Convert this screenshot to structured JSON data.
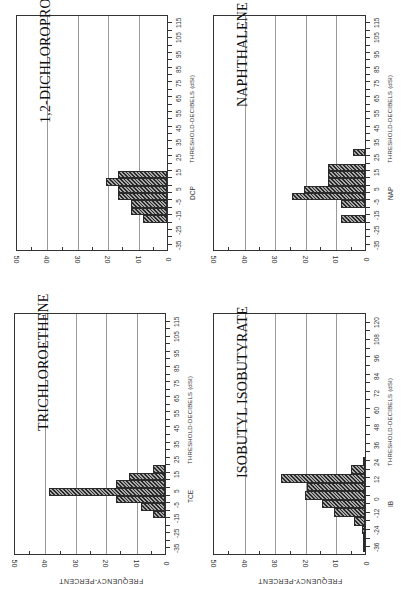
{
  "page": {
    "orientation": "rotated-90-ccw",
    "axis_ylabel": "FREQUENCY-PERCENT"
  },
  "chart_data": [
    {
      "type": "bar",
      "title": "1,2-DICHLOROPROPANE",
      "short_label": "DCP",
      "xlabel": "THRESHOLD-DECIBELS (dSI)",
      "ylabel": "FREQUENCY-PERCENT",
      "ylim": [
        0,
        50
      ],
      "yticks": [
        0,
        10,
        20,
        30,
        40,
        50
      ],
      "xlim": [
        -40,
        120
      ],
      "xticks": [
        -35,
        -25,
        -15,
        -5,
        5,
        15,
        25,
        35,
        45,
        55,
        65,
        75,
        85,
        95,
        105,
        115
      ],
      "bin_width": 5,
      "x": [
        -17.5,
        -12.5,
        -7.5,
        -2.5,
        2.5,
        7.5,
        12.5
      ],
      "values": [
        8,
        12,
        12,
        16,
        16,
        20,
        16
      ],
      "grid": true
    },
    {
      "type": "bar",
      "title": "TRICHLOROETHENE",
      "short_label": "TCE",
      "xlabel": "THRESHOLD-DECIBELS (dSI)",
      "ylabel": "FREQUENCY-PERCENT",
      "ylim": [
        0,
        50
      ],
      "yticks": [
        0,
        10,
        20,
        30,
        40,
        50
      ],
      "xlim": [
        -40,
        120
      ],
      "xticks": [
        -35,
        -25,
        -15,
        -5,
        5,
        15,
        25,
        35,
        45,
        55,
        65,
        75,
        85,
        95,
        105,
        115
      ],
      "bin_width": 5,
      "x": [
        -12.5,
        -7.5,
        -2.5,
        2.5,
        7.5,
        12.5,
        17.5
      ],
      "values": [
        4,
        8,
        16,
        38,
        16,
        12,
        4
      ],
      "grid": true
    },
    {
      "type": "bar",
      "title": "NAPHTHALENE",
      "short_label": "NAP",
      "xlabel": "THRESHOLD-DECIBELS (dSI)",
      "ylabel": "FREQUENCY-PERCENT",
      "ylim": [
        0,
        50
      ],
      "yticks": [
        0,
        10,
        20,
        30,
        40,
        50
      ],
      "xlim": [
        -40,
        120
      ],
      "xticks": [
        -35,
        -25,
        -15,
        -5,
        5,
        15,
        25,
        35,
        45,
        55,
        65,
        75,
        85,
        95,
        105,
        115
      ],
      "bin_width": 5,
      "x": [
        -17.5,
        -7.5,
        -2.5,
        2.5,
        7.5,
        12.5,
        17.5,
        27.5
      ],
      "values": [
        8,
        8,
        24,
        20,
        12,
        12,
        12,
        4
      ],
      "grid": true
    },
    {
      "type": "bar",
      "title": "ISOBUTYL ISOBUTYRATE",
      "short_label": "IB",
      "xlabel": "THRESHOLD-DECIBELS (dSI)",
      "ylabel": "FREQUENCY-PERCENT",
      "ylim": [
        0,
        50
      ],
      "yticks": [
        0,
        10,
        20,
        30,
        40,
        50
      ],
      "xlim": [
        -42,
        126
      ],
      "xticks": [
        -36,
        -24,
        -12,
        0,
        12,
        24,
        36,
        48,
        60,
        72,
        84,
        96,
        108,
        120
      ],
      "bin_width": 6,
      "x": [
        -36,
        -30,
        -24,
        -18,
        -12,
        -6,
        0,
        6,
        12,
        18,
        24
      ],
      "values": [
        0.5,
        0.5,
        1,
        3.5,
        10,
        14,
        19.5,
        19,
        27.5,
        4.5,
        0.5
      ],
      "grid": true
    }
  ]
}
